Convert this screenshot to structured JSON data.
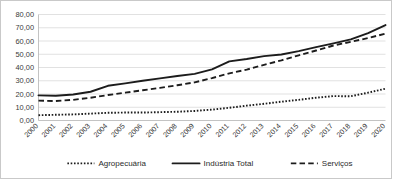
{
  "chart_data": {
    "type": "line",
    "title": "",
    "subtitle": "",
    "xlabel": "",
    "ylabel": "",
    "ylim": [
      0,
      80
    ],
    "ytick_labels": [
      "0,00",
      "10,00",
      "20,00",
      "30,00",
      "40,00",
      "50,00",
      "60,00",
      "70,00",
      "80,00"
    ],
    "ytick_values": [
      0,
      10,
      20,
      30,
      40,
      50,
      60,
      70,
      80
    ],
    "grid": true,
    "legend_position": "bottom",
    "decimal_separator": ",",
    "categories": [
      "2000",
      "2001",
      "2002",
      "2003",
      "2004",
      "2005",
      "2006",
      "2007",
      "2008",
      "2009",
      "2010",
      "2011",
      "2012",
      "2013",
      "2014",
      "2015",
      "2016",
      "2017",
      "2018",
      "2019",
      "2020"
    ],
    "series": [
      {
        "name": "Agropecuária",
        "style": "dotted",
        "color": "#1c1c1c",
        "values": [
          4.0,
          4.3,
          4.6,
          5.2,
          5.8,
          6.0,
          6.0,
          6.3,
          6.6,
          7.2,
          8.2,
          9.6,
          11.2,
          12.6,
          14.2,
          15.6,
          17.2,
          18.4,
          18.3,
          21.0,
          24.0
        ]
      },
      {
        "name": "Indústria Total",
        "style": "solid",
        "color": "#1c1c1c",
        "values": [
          19.0,
          18.7,
          19.6,
          21.7,
          26.2,
          28.0,
          30.0,
          31.8,
          33.6,
          35.2,
          38.6,
          44.6,
          46.4,
          48.6,
          49.8,
          52.4,
          55.4,
          58.2,
          61.2,
          66.0,
          72.0
        ]
      },
      {
        "name": "Serviços",
        "style": "dashed",
        "color": "#1c1c1c",
        "values": [
          15.0,
          14.7,
          15.6,
          17.2,
          19.2,
          21.0,
          22.8,
          24.6,
          26.6,
          28.8,
          32.0,
          35.6,
          38.4,
          42.0,
          45.4,
          49.2,
          52.8,
          56.6,
          59.4,
          62.2,
          65.6
        ]
      }
    ],
    "legend": [
      {
        "label": "Agropecuária",
        "style": "dotted"
      },
      {
        "label": "Indústria Total",
        "style": "solid"
      },
      {
        "label": "Serviços",
        "style": "dashed"
      }
    ]
  }
}
